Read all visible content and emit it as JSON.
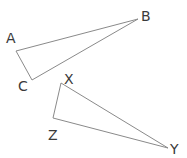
{
  "diagram": {
    "type": "geometry-triangles",
    "triangles": [
      {
        "name": "ABC",
        "vertices": [
          {
            "label": "A",
            "x": 16,
            "y": 51,
            "label_x": 6,
            "label_y": 43
          },
          {
            "label": "B",
            "x": 138,
            "y": 19,
            "label_x": 141,
            "label_y": 21
          },
          {
            "label": "C",
            "x": 32,
            "y": 80,
            "label_x": 18,
            "label_y": 91
          }
        ]
      },
      {
        "name": "XYZ",
        "vertices": [
          {
            "label": "X",
            "x": 61,
            "y": 83,
            "label_x": 64,
            "label_y": 84
          },
          {
            "label": "Y",
            "x": 168,
            "y": 148,
            "label_x": 170,
            "label_y": 154
          },
          {
            "label": "Z",
            "x": 53,
            "y": 118,
            "label_x": 48,
            "label_y": 140
          }
        ]
      }
    ],
    "colors": {
      "stroke": "#8a8a8a",
      "label": "#3a3a3a",
      "background": "#ffffff"
    }
  }
}
